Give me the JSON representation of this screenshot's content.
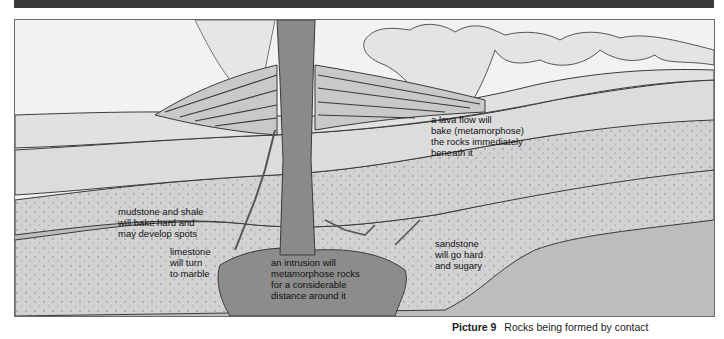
{
  "figure": {
    "caption_number": "Picture 9",
    "caption_text": "Rocks being formed by contact",
    "labels": {
      "lava_flow": "a lava flow will\nbake (metamorphose)\nthe rocks immediately\nbeneath it",
      "mudstone": "mudstone and shale\nwill bake hard and\nmay develop spots",
      "limestone": "limestone\nwill turn\nto marble",
      "intrusion": "an intrusion will\nmetamorphose rocks\nfor a considerable\ndistance around it",
      "sandstone": "sandstone\nwill go hard\nand sugary"
    },
    "colors": {
      "background": "#f2f2f2",
      "light_rock": "#d9d9d9",
      "speckled_rock": "#cfcfcf",
      "mid_rock": "#b8b8b8",
      "intrusion": "#8a8a8a",
      "outline": "#3a3a3a",
      "top_bar": "#3a3a3a"
    }
  }
}
